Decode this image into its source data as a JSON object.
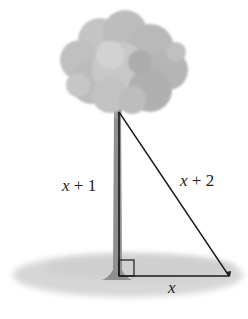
{
  "diagram": {
    "type": "right-triangle-word-problem",
    "scene": "tree with support wire forming a right triangle",
    "labels": {
      "vertical_side": {
        "var": "x",
        "rest": " + 1"
      },
      "hypotenuse": {
        "var": "x",
        "rest": " + 2"
      },
      "base": {
        "var": "x"
      }
    },
    "colors": {
      "line": "#1a1a1a",
      "foliage": "#bdbdbd",
      "trunk": "#8f8f8f",
      "ground": "#d4d4d4"
    }
  }
}
